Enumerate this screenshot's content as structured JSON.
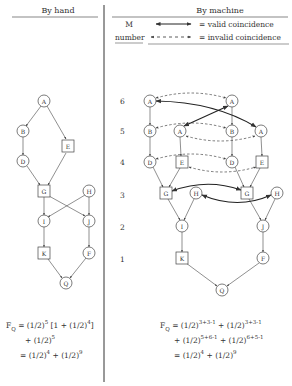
{
  "headers": {
    "left": "By hand",
    "right": "By machine"
  },
  "legend": {
    "m_label": "M",
    "number_label": "number",
    "valid": "= valid coincidence",
    "invalid": "= invalid coincidence"
  },
  "row_labels": [
    "6",
    "5",
    "4",
    "3",
    "2",
    "1"
  ],
  "left_graph": {
    "nodes": [
      {
        "id": "A",
        "shape": "circle"
      },
      {
        "id": "B",
        "shape": "circle"
      },
      {
        "id": "E",
        "shape": "square"
      },
      {
        "id": "D",
        "shape": "circle"
      },
      {
        "id": "G",
        "shape": "square"
      },
      {
        "id": "H",
        "shape": "circle"
      },
      {
        "id": "I",
        "shape": "circle"
      },
      {
        "id": "J",
        "shape": "circle"
      },
      {
        "id": "K",
        "shape": "square"
      },
      {
        "id": "F",
        "shape": "circle"
      },
      {
        "id": "Q",
        "shape": "circle"
      }
    ],
    "edges": [
      [
        "A",
        "B"
      ],
      [
        "A",
        "E"
      ],
      [
        "B",
        "D"
      ],
      [
        "D",
        "G"
      ],
      [
        "E",
        "G"
      ],
      [
        "G",
        "I"
      ],
      [
        "G",
        "J"
      ],
      [
        "H",
        "I"
      ],
      [
        "H",
        "J"
      ],
      [
        "I",
        "K"
      ],
      [
        "J",
        "F"
      ],
      [
        "K",
        "Q"
      ],
      [
        "F",
        "Q"
      ]
    ]
  },
  "right_graph": {
    "nodes": [
      "A",
      "A",
      "B",
      "A",
      "B",
      "A",
      "D",
      "E",
      "D",
      "E",
      "G",
      "H",
      "G",
      "H",
      "I",
      "J",
      "K",
      "F",
      "Q"
    ]
  },
  "formulas": {
    "left": {
      "lhs": "F",
      "lhs_sub": "Q",
      "line1": "= (1/2)",
      "line1_exp": "5",
      "line1_rest": " [1 + (1/2)",
      "line1_exp2": "4",
      "line1_end": "]",
      "line2": "+ (1/2)",
      "line2_exp": "5",
      "line3a": "= (1/2)",
      "line3a_exp": "4",
      "line3b": " + (1/2)",
      "line3b_exp": "9"
    },
    "right": {
      "lhs": "F",
      "lhs_sub": "Q",
      "line1a": "= (1/2)",
      "line1a_exp": "3+3-1",
      "line1b": " + (1/2)",
      "line1b_exp": "3+3-1",
      "line2a": "+ (1/2)",
      "line2a_exp": "5+6-1",
      "line2b": " + (1/2)",
      "line2b_exp": "6+5-1",
      "line3a": "= (1/2)",
      "line3a_exp": "4",
      "line3b": " + (1/2)",
      "line3b_exp": "9"
    }
  }
}
